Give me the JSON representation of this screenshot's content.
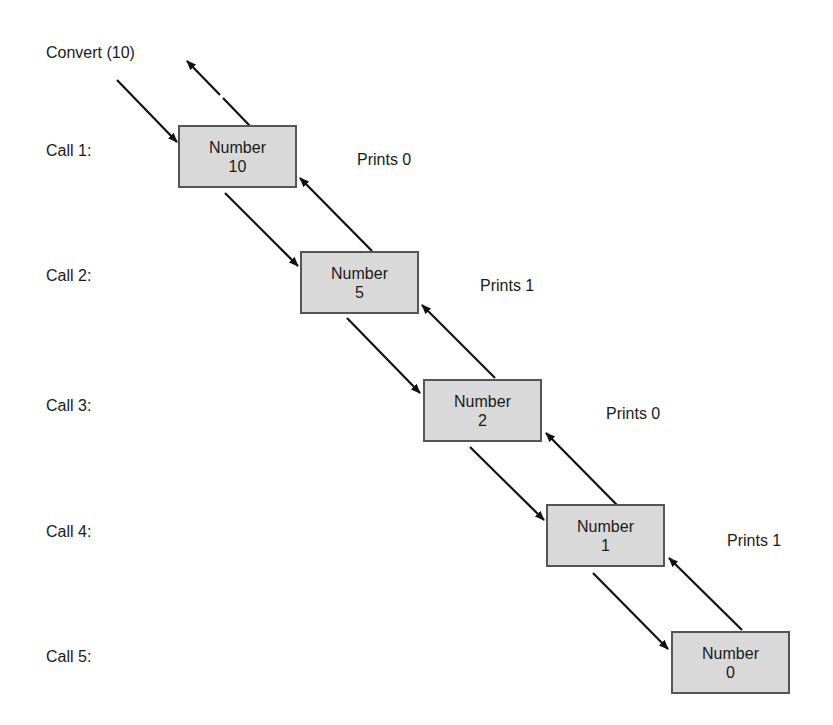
{
  "diagram": {
    "title": "Convert (10)",
    "calls": [
      {
        "label": "Call 1:",
        "box_label": "Number",
        "value": "10",
        "prints": "Prints 0"
      },
      {
        "label": "Call 2:",
        "box_label": "Number",
        "value": "5",
        "prints": "Prints 1"
      },
      {
        "label": "Call 3:",
        "box_label": "Number",
        "value": "2",
        "prints": "Prints 0"
      },
      {
        "label": "Call 4:",
        "box_label": "Number",
        "value": "1",
        "prints": "Prints 1"
      },
      {
        "label": "Call 5:",
        "box_label": "Number",
        "value": "0"
      }
    ],
    "colors": {
      "box_fill": "#d9d9d9",
      "box_border": "#555555",
      "arrow": "#111111"
    }
  }
}
